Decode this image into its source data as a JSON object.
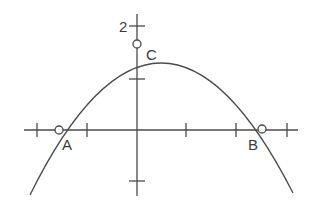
{
  "diagram": {
    "type": "parabola-on-axes",
    "y_axis_label": "2",
    "points": [
      {
        "name": "A",
        "label": "A",
        "x": -1.56,
        "y": 0
      },
      {
        "name": "B",
        "label": "B",
        "x": 2.5,
        "y": 0
      },
      {
        "name": "C",
        "label": "C",
        "x": 0,
        "y": 1.65
      }
    ],
    "x_ticks": [
      -2,
      -1,
      0,
      1,
      2,
      3
    ],
    "y_ticks": [
      -1,
      0,
      1,
      2
    ],
    "colors": {
      "stroke": "#4a4a4a",
      "text": "#3a3a3a",
      "background": "#ffffff"
    }
  }
}
